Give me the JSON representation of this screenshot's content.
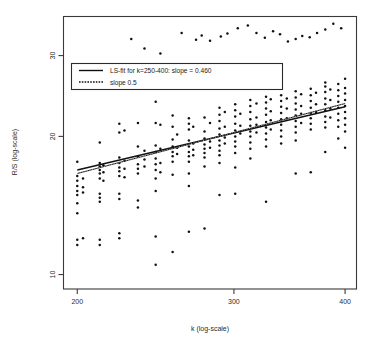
{
  "chart_data": {
    "type": "scatter",
    "title": "",
    "xlabel": "k (log-scale)",
    "ylabel": "R/S (log-scale)",
    "xscale": "log",
    "yscale": "log",
    "xlim": [
      193,
      412
    ],
    "ylim": [
      9.3,
      36.5
    ],
    "xticks": [
      200,
      300,
      400
    ],
    "xticklabels": [
      "200",
      "300",
      "400"
    ],
    "yticks": [
      10,
      20,
      30
    ],
    "yticklabels": [
      "10",
      "20",
      "30"
    ],
    "grid": false,
    "legend_position": "top-left",
    "legend": [
      {
        "label": "LS-fit for k=250-400: slope = 0.460",
        "style": "solid"
      },
      {
        "label": "slope 0.5",
        "style": "dotted"
      }
    ],
    "series": [
      {
        "name": "R/S statistic",
        "marker": "point",
        "color": "#111111",
        "points": [
          [
            200,
            17.6
          ],
          [
            200,
            16.4
          ],
          [
            200,
            16.0
          ],
          [
            200,
            15.6
          ],
          [
            200,
            15.2
          ],
          [
            200,
            14.9
          ],
          [
            200,
            14.3
          ],
          [
            200,
            13.6
          ],
          [
            200,
            11.9
          ],
          [
            200,
            11.6
          ],
          [
            203,
            16.2
          ],
          [
            203,
            15.5
          ],
          [
            203,
            15.1
          ],
          [
            203,
            12.0
          ],
          [
            212,
            19.4
          ],
          [
            212,
            17.5
          ],
          [
            212,
            17.2
          ],
          [
            212,
            16.9
          ],
          [
            212,
            16.6
          ],
          [
            212,
            16.2
          ],
          [
            212,
            15.0
          ],
          [
            212,
            14.7
          ],
          [
            212,
            14.4
          ],
          [
            212,
            11.9
          ],
          [
            212,
            11.6
          ],
          [
            214,
            17.3
          ],
          [
            214,
            16.7
          ],
          [
            214,
            16.0
          ],
          [
            223,
            21.3
          ],
          [
            223,
            20.4
          ],
          [
            223,
            18.0
          ],
          [
            223,
            17.5
          ],
          [
            223,
            17.1
          ],
          [
            223,
            16.8
          ],
          [
            223,
            16.4
          ],
          [
            223,
            15.0
          ],
          [
            223,
            14.6
          ],
          [
            223,
            12.3
          ],
          [
            223,
            12.0
          ],
          [
            226,
            20.6
          ],
          [
            226,
            17.7
          ],
          [
            226,
            17.0
          ],
          [
            226,
            16.3
          ],
          [
            234,
            21.4
          ],
          [
            234,
            19.0
          ],
          [
            234,
            18.1
          ],
          [
            234,
            17.4
          ],
          [
            234,
            17.0
          ],
          [
            234,
            16.6
          ],
          [
            234,
            14.5
          ],
          [
            234,
            14.0
          ],
          [
            238,
            18.6
          ],
          [
            238,
            17.8
          ],
          [
            238,
            17.2
          ],
          [
            245,
            23.8
          ],
          [
            245,
            21.4
          ],
          [
            245,
            19.1
          ],
          [
            245,
            18.5
          ],
          [
            245,
            17.9
          ],
          [
            245,
            17.4
          ],
          [
            245,
            16.9
          ],
          [
            245,
            16.2
          ],
          [
            245,
            15.2
          ],
          [
            245,
            12.1
          ],
          [
            245,
            10.5
          ],
          [
            248,
            21.2
          ],
          [
            248,
            18.8
          ],
          [
            248,
            17.5
          ],
          [
            248,
            16.7
          ],
          [
            256,
            22.2
          ],
          [
            256,
            21.0
          ],
          [
            256,
            19.7
          ],
          [
            256,
            19.0
          ],
          [
            256,
            18.5
          ],
          [
            256,
            18.1
          ],
          [
            256,
            17.6
          ],
          [
            256,
            16.5
          ],
          [
            256,
            11.2
          ],
          [
            259,
            20.2
          ],
          [
            259,
            18.9
          ],
          [
            259,
            18.3
          ],
          [
            267,
            21.9
          ],
          [
            267,
            21.3
          ],
          [
            267,
            20.7
          ],
          [
            267,
            19.6
          ],
          [
            267,
            19.0
          ],
          [
            267,
            18.5
          ],
          [
            267,
            18.1
          ],
          [
            267,
            17.6
          ],
          [
            267,
            16.6
          ],
          [
            267,
            15.6
          ],
          [
            267,
            12.4
          ],
          [
            270,
            21.0
          ],
          [
            270,
            19.3
          ],
          [
            270,
            18.7
          ],
          [
            270,
            18.2
          ],
          [
            278,
            22.0
          ],
          [
            278,
            20.5
          ],
          [
            278,
            19.8
          ],
          [
            278,
            19.2
          ],
          [
            278,
            18.8
          ],
          [
            278,
            18.4
          ],
          [
            278,
            18.0
          ],
          [
            278,
            17.2
          ],
          [
            278,
            12.6
          ],
          [
            282,
            21.4
          ],
          [
            282,
            19.5
          ],
          [
            282,
            18.9
          ],
          [
            289,
            23.1
          ],
          [
            289,
            22.3
          ],
          [
            289,
            21.6
          ],
          [
            289,
            20.8
          ],
          [
            289,
            20.2
          ],
          [
            289,
            19.6
          ],
          [
            289,
            19.1
          ],
          [
            289,
            18.6
          ],
          [
            289,
            18.2
          ],
          [
            289,
            17.5
          ],
          [
            289,
            14.9
          ],
          [
            293,
            22.6
          ],
          [
            293,
            21.0
          ],
          [
            293,
            19.9
          ],
          [
            293,
            19.3
          ],
          [
            301,
            23.5
          ],
          [
            301,
            22.8
          ],
          [
            301,
            22.1
          ],
          [
            301,
            21.3
          ],
          [
            301,
            20.6
          ],
          [
            301,
            20.0
          ],
          [
            301,
            19.5
          ],
          [
            301,
            19.0
          ],
          [
            301,
            18.4
          ],
          [
            301,
            17.1
          ],
          [
            301,
            15.0
          ],
          [
            305,
            22.4
          ],
          [
            305,
            21.1
          ],
          [
            305,
            20.3
          ],
          [
            313,
            24.0
          ],
          [
            313,
            23.3
          ],
          [
            313,
            22.6
          ],
          [
            313,
            21.8
          ],
          [
            313,
            21.1
          ],
          [
            313,
            20.5
          ],
          [
            313,
            20.0
          ],
          [
            313,
            19.4
          ],
          [
            313,
            18.8
          ],
          [
            313,
            17.9
          ],
          [
            318,
            23.6
          ],
          [
            318,
            22.0
          ],
          [
            318,
            21.2
          ],
          [
            318,
            20.4
          ],
          [
            326,
            24.4
          ],
          [
            326,
            23.7
          ],
          [
            326,
            23.0
          ],
          [
            326,
            22.3
          ],
          [
            326,
            21.5
          ],
          [
            326,
            20.9
          ],
          [
            326,
            20.3
          ],
          [
            326,
            19.7
          ],
          [
            326,
            19.0
          ],
          [
            326,
            14.4
          ],
          [
            330,
            24.1
          ],
          [
            330,
            22.7
          ],
          [
            330,
            21.7
          ],
          [
            330,
            20.7
          ],
          [
            339,
            24.6
          ],
          [
            339,
            23.9
          ],
          [
            339,
            23.2
          ],
          [
            339,
            22.5
          ],
          [
            339,
            21.8
          ],
          [
            339,
            21.2
          ],
          [
            339,
            20.6
          ],
          [
            339,
            20.0
          ],
          [
            339,
            19.3
          ],
          [
            344,
            24.2
          ],
          [
            344,
            23.0
          ],
          [
            344,
            21.9
          ],
          [
            352,
            25.1
          ],
          [
            352,
            24.3
          ],
          [
            352,
            23.6
          ],
          [
            352,
            22.9
          ],
          [
            352,
            22.2
          ],
          [
            352,
            21.6
          ],
          [
            352,
            21.0
          ],
          [
            352,
            20.4
          ],
          [
            352,
            19.6
          ],
          [
            352,
            16.6
          ],
          [
            357,
            24.7
          ],
          [
            357,
            23.3
          ],
          [
            357,
            22.4
          ],
          [
            357,
            21.4
          ],
          [
            366,
            25.4
          ],
          [
            366,
            24.6
          ],
          [
            366,
            23.9
          ],
          [
            366,
            23.1
          ],
          [
            366,
            22.5
          ],
          [
            366,
            21.9
          ],
          [
            366,
            21.3
          ],
          [
            366,
            20.7
          ],
          [
            366,
            16.7
          ],
          [
            371,
            24.9
          ],
          [
            371,
            23.5
          ],
          [
            371,
            22.6
          ],
          [
            380,
            26.2
          ],
          [
            380,
            25.7
          ],
          [
            380,
            25.0
          ],
          [
            380,
            24.2
          ],
          [
            380,
            23.5
          ],
          [
            380,
            22.8
          ],
          [
            380,
            22.1
          ],
          [
            380,
            21.5
          ],
          [
            380,
            20.9
          ],
          [
            380,
            18.5
          ],
          [
            385,
            25.3
          ],
          [
            385,
            24.0
          ],
          [
            385,
            23.0
          ],
          [
            385,
            22.0
          ],
          [
            393,
            26.0
          ],
          [
            393,
            25.2
          ],
          [
            393,
            24.5
          ],
          [
            393,
            23.8
          ],
          [
            393,
            23.1
          ],
          [
            393,
            22.4
          ],
          [
            393,
            21.7
          ],
          [
            393,
            21.0
          ],
          [
            393,
            19.8
          ],
          [
            400,
            26.7
          ],
          [
            400,
            25.5
          ],
          [
            400,
            24.8
          ],
          [
            400,
            24.0
          ],
          [
            400,
            23.3
          ],
          [
            400,
            22.6
          ],
          [
            400,
            21.9
          ],
          [
            400,
            21.2
          ],
          [
            400,
            20.5
          ],
          [
            400,
            18.9
          ],
          [
            230,
            32.6
          ],
          [
            238,
            31.1
          ],
          [
            248,
            30.3
          ],
          [
            262,
            33.6
          ],
          [
            272,
            32.5
          ],
          [
            276,
            33.2
          ],
          [
            282,
            32.3
          ],
          [
            290,
            33.0
          ],
          [
            295,
            33.5
          ],
          [
            303,
            34.4
          ],
          [
            311,
            34.9
          ],
          [
            318,
            33.6
          ],
          [
            325,
            32.8
          ],
          [
            332,
            33.9
          ],
          [
            338,
            33.4
          ],
          [
            345,
            32.2
          ],
          [
            352,
            32.6
          ],
          [
            358,
            33.1
          ],
          [
            365,
            32.9
          ],
          [
            372,
            33.6
          ],
          [
            380,
            34.2
          ],
          [
            388,
            35.2
          ],
          [
            396,
            34.4
          ]
        ]
      }
    ],
    "fit_line": {
      "label": "LS-fit for k=250-400: slope = 0.460",
      "slope": 0.46,
      "style": "solid",
      "x_start": 200,
      "y_start": 16.9,
      "x_end": 400,
      "y_end": 23.2
    },
    "reference_line": {
      "label": "slope 0.5",
      "slope": 0.5,
      "style": "dotted",
      "x_start": 200,
      "y_start": 16.6,
      "x_end": 400,
      "y_end": 23.6
    }
  }
}
